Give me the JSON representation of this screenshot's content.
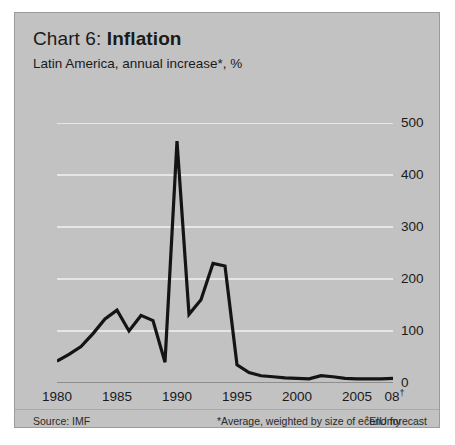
{
  "panel": {
    "background_color": "#c2c2c2",
    "border_color": "#9b9b9b"
  },
  "header": {
    "title_number": "Chart 6: ",
    "title_name": "Inflation",
    "subtitle": "Latin America, annual increase*, %"
  },
  "footer": {
    "source": "Source: IMF",
    "note": "*Average, weighted by size of economy",
    "forecast": "EIU forecast",
    "forecast_marker": "†"
  },
  "chart_data": {
    "type": "line",
    "title": "Chart 6: Inflation",
    "subtitle": "Latin America, annual increase*, %",
    "xlabel": "",
    "ylabel": "%",
    "xlim": [
      1980,
      2008
    ],
    "ylim": [
      0,
      500
    ],
    "grid": "horizontal",
    "legend": "none",
    "y_ticks": [
      0,
      100,
      200,
      300,
      400,
      500
    ],
    "y_tick_labels": [
      "0",
      "100",
      "200",
      "300",
      "400",
      "500"
    ],
    "y_axis_position": "right",
    "x_ticks": [
      1980,
      1985,
      1990,
      1995,
      2000,
      2005,
      2008
    ],
    "x_tick_labels": [
      "1980",
      "1985",
      "1990",
      "1995",
      "2000",
      "2005",
      "08"
    ],
    "x_minor_tick_interval": 1,
    "line_color": "#141414",
    "line_width": 3.2,
    "series": [
      {
        "name": "Latin America inflation, annual increase (%)",
        "x": [
          1980,
          1981,
          1982,
          1983,
          1984,
          1985,
          1986,
          1987,
          1988,
          1989,
          1990,
          1991,
          1992,
          1993,
          1994,
          1995,
          1996,
          1997,
          1998,
          1999,
          2000,
          2001,
          2002,
          2003,
          2004,
          2005,
          2006,
          2007,
          2008
        ],
        "values": [
          42,
          55,
          70,
          95,
          123,
          140,
          100,
          130,
          120,
          40,
          465,
          132,
          160,
          230,
          225,
          35,
          20,
          14,
          12,
          10,
          9,
          8,
          14,
          12,
          9,
          8,
          8,
          8,
          9
        ]
      }
    ],
    "annotations": [
      {
        "text": "08† = EIU forecast",
        "x": 2008
      }
    ]
  }
}
